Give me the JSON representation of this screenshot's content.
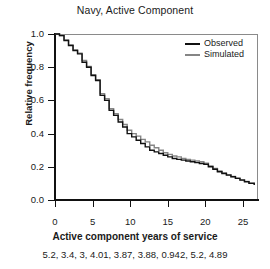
{
  "chart_data": {
    "type": "line",
    "title": "Navy, Active Component",
    "xlabel": "Active component years of service",
    "ylabel": "Relative frequency",
    "xlim": [
      0,
      27
    ],
    "ylim": [
      0.0,
      1.0
    ],
    "grid": false,
    "legend_position": "top-right",
    "step": true,
    "xticks": [
      0,
      5,
      10,
      15,
      20,
      25
    ],
    "xtick_labels": [
      "0",
      "5",
      "10",
      "15",
      "20",
      "25"
    ],
    "yticks": [
      0.0,
      0.2,
      0.4,
      0.6,
      0.8,
      1.0
    ],
    "ytick_labels": [
      "0.0",
      "0.2",
      "0.4",
      "0.6",
      "0.8",
      "1.0"
    ],
    "series": [
      {
        "name": "Observed",
        "color": "#111111",
        "x": [
          0,
          0.6,
          1.2,
          1.8,
          2.4,
          3.0,
          3.6,
          4.2,
          4.8,
          5.4,
          6.0,
          6.6,
          7.2,
          7.8,
          8.4,
          9.0,
          9.6,
          10.2,
          10.8,
          11.4,
          12.0,
          12.6,
          13.2,
          13.8,
          14.4,
          15.0,
          15.6,
          16.2,
          16.8,
          17.4,
          18.0,
          18.6,
          19.2,
          19.8,
          20.4,
          21.0,
          21.6,
          22.2,
          22.8,
          23.4,
          24.0,
          24.6,
          25.2,
          25.8,
          26.5
        ],
        "values": [
          1.0,
          0.99,
          0.96,
          0.93,
          0.9,
          0.88,
          0.83,
          0.8,
          0.75,
          0.72,
          0.63,
          0.6,
          0.54,
          0.51,
          0.47,
          0.44,
          0.4,
          0.38,
          0.36,
          0.34,
          0.32,
          0.3,
          0.29,
          0.28,
          0.27,
          0.26,
          0.25,
          0.245,
          0.24,
          0.235,
          0.23,
          0.225,
          0.22,
          0.215,
          0.2,
          0.185,
          0.17,
          0.16,
          0.15,
          0.14,
          0.13,
          0.12,
          0.11,
          0.1,
          0.09
        ]
      },
      {
        "name": "Simulated",
        "color": "#858585",
        "x": [
          0,
          0.6,
          1.2,
          1.8,
          2.4,
          3.0,
          3.6,
          4.2,
          4.8,
          5.4,
          6.0,
          6.6,
          7.2,
          7.8,
          8.4,
          9.0,
          9.6,
          10.2,
          10.8,
          11.4,
          12.0,
          12.6,
          13.2,
          13.8,
          14.4,
          15.0,
          15.6,
          16.2,
          16.8,
          17.4,
          18.0,
          18.6,
          19.2,
          19.8,
          20.4,
          21.0,
          21.6,
          22.2,
          22.8,
          23.4,
          24.0,
          24.6,
          25.2,
          25.8,
          26.5
        ],
        "values": [
          1.0,
          0.99,
          0.965,
          0.935,
          0.905,
          0.885,
          0.84,
          0.805,
          0.755,
          0.725,
          0.64,
          0.61,
          0.55,
          0.52,
          0.485,
          0.455,
          0.42,
          0.4,
          0.385,
          0.365,
          0.35,
          0.33,
          0.315,
          0.3,
          0.285,
          0.275,
          0.265,
          0.26,
          0.25,
          0.245,
          0.24,
          0.235,
          0.23,
          0.222,
          0.205,
          0.19,
          0.175,
          0.163,
          0.152,
          0.142,
          0.132,
          0.122,
          0.112,
          0.102,
          0.092
        ]
      }
    ],
    "caption": "5.2, 3.4, 3, 4.01, 3.87, 3.88, 0.942, 5.2, 4.89"
  },
  "legend": {
    "items": [
      {
        "label": "Observed",
        "color": "#111111"
      },
      {
        "label": "Simulated",
        "color": "#858585"
      }
    ]
  }
}
